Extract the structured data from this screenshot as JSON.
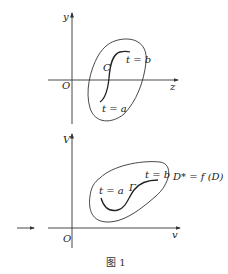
{
  "top_figure": {
    "y_axis_label": "y",
    "x_axis_label": "z",
    "origin_label": "O",
    "curve_label": "C",
    "start_label": "t = a",
    "end_label": "t = b"
  },
  "bottom_figure": {
    "y_axis_label": "V",
    "x_axis_label": "v",
    "origin_label": "O",
    "curve_label": "Γ",
    "start_label": "t = a",
    "end_label": "t = b",
    "region_label": "D* = f (D)"
  },
  "caption": "图 1",
  "colors": {
    "stroke": "#333333",
    "background": "#ffffff"
  }
}
